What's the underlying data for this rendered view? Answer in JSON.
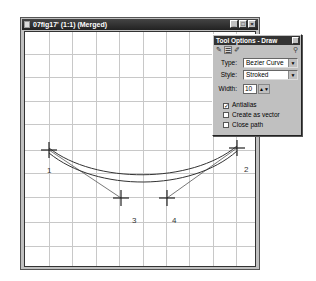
{
  "window": {
    "title": "07fig17' (1:1) (Merged)",
    "buttons": [
      {
        "name": "minimize",
        "glyph": "_"
      },
      {
        "name": "maximize",
        "glyph": "□"
      },
      {
        "name": "close",
        "glyph": "×"
      }
    ]
  },
  "canvas": {
    "grid_color": "#c8c8c8",
    "grid_spacing": 23.4,
    "curve_color": "#444444",
    "points": [
      {
        "label": "1",
        "x": 24,
        "y": 118
      },
      {
        "label": "2",
        "x": 212,
        "y": 116
      },
      {
        "label": "3",
        "x": 96,
        "y": 166
      },
      {
        "label": "4",
        "x": 142,
        "y": 166
      }
    ]
  },
  "tool_options": {
    "title": "Tool Options - Draw",
    "tabs": [
      "brush-tab",
      "options-tab",
      "pen-tab"
    ],
    "type_label": "Type:",
    "type_value": "Bezier Curve",
    "style_label": "Style:",
    "style_value": "Stroked",
    "width_label": "Width:",
    "width_value": "10",
    "checkboxes": [
      {
        "label": "Antialias",
        "checked": true
      },
      {
        "label": "Create as vector",
        "checked": false
      },
      {
        "label": "Close path",
        "checked": false
      }
    ]
  }
}
